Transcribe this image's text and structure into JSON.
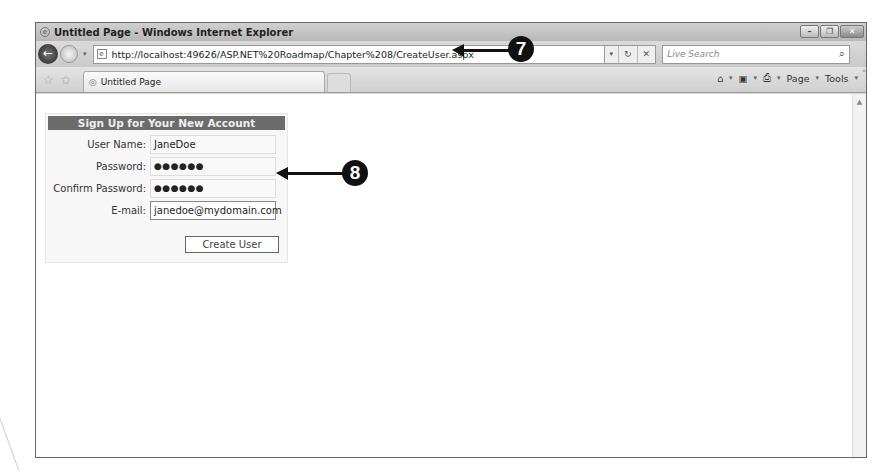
{
  "window": {
    "title": "Untitled Page - Windows Internet Explorer",
    "controls": {
      "minimize": "–",
      "restore": "❐",
      "close": "✕"
    }
  },
  "navbar": {
    "back_icon": "←",
    "url": "http://localhost:49626/ASP.NET%20Roadmap/Chapter%208/CreateUser.aspx",
    "dropdown": "▾",
    "refresh": "↻",
    "stop": "✕",
    "search_placeholder": "Live Search",
    "search_icon": "⌕"
  },
  "tabbar": {
    "favorites_icon": "☆",
    "add_favorites_icon": "✩",
    "tab_label": "Untitled Page",
    "commands": {
      "home": "⌂",
      "feeds": "▣",
      "print": "⎙",
      "page": "Page",
      "tools": "Tools",
      "more": "»"
    }
  },
  "form": {
    "header": "Sign Up for Your New Account",
    "fields": [
      {
        "label": "User Name:",
        "value": "JaneDoe"
      },
      {
        "label": "Password:",
        "value": "●●●●●●"
      },
      {
        "label": "Confirm Password:",
        "value": "●●●●●●"
      },
      {
        "label": "E-mail:",
        "value": "janedoe@mydomain.com"
      }
    ],
    "submit_label": "Create User"
  },
  "callouts": {
    "seven": "7",
    "eight": "8"
  }
}
